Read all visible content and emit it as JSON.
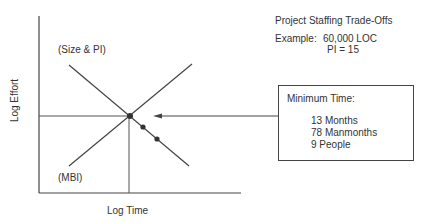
{
  "diagram": {
    "title": "Project Staffing Trade-Offs",
    "example_label": "Example:",
    "example_loc": "60,000 LOC",
    "example_pi": "PI = 15",
    "x_axis_label": "Log Time",
    "y_axis_label": "Log Effort",
    "line_labels": {
      "size_pi": "(Size & PI)",
      "mbi": "(MBI)"
    },
    "callout": {
      "title": "Minimum Time:",
      "lines": [
        "13 Months",
        "78 Manmonths",
        "9 People"
      ]
    },
    "colors": {
      "line": "#444444",
      "text": "#333333",
      "background": "#ffffff"
    }
  }
}
